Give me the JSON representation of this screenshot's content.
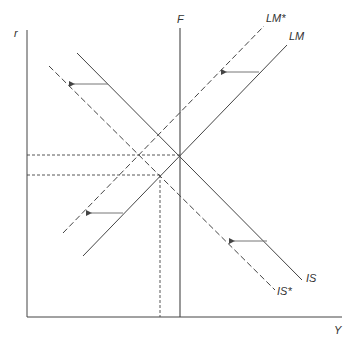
{
  "diagram": {
    "type": "IS-LM-F diagram",
    "axes": {
      "y_label": "r",
      "x_label": "Y"
    },
    "curves": {
      "F": {
        "label": "F",
        "style": "solid",
        "orientation": "vertical"
      },
      "LM": {
        "label": "LM",
        "style": "solid"
      },
      "LM_star": {
        "label": "LM*",
        "style": "dashed"
      },
      "IS": {
        "label": "IS",
        "style": "solid"
      },
      "IS_star": {
        "label": "IS*",
        "style": "dashed"
      }
    },
    "shifts": [
      {
        "from": "IS",
        "to": "IS*",
        "direction": "left"
      },
      {
        "from": "LM",
        "to": "LM*",
        "direction": "left"
      }
    ],
    "equilibria": [
      {
        "name": "initial",
        "curves": [
          "IS",
          "LM",
          "F"
        ]
      },
      {
        "name": "new",
        "curves": [
          "IS*",
          "LM"
        ]
      }
    ],
    "colors": {
      "line": "#333333",
      "arrow": "#777777",
      "background": "#ffffff"
    }
  }
}
